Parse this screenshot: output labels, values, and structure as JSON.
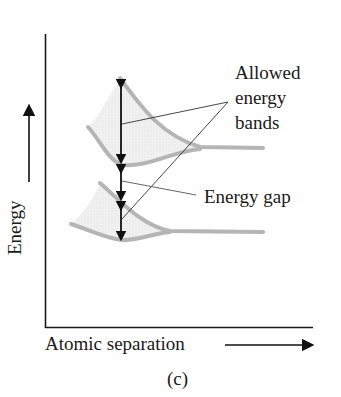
{
  "figure": {
    "panel_label": "(c)",
    "axes": {
      "x_label": "Atomic separation",
      "y_label": "Energy"
    },
    "annotations": {
      "allowed_line1": "Allowed",
      "allowed_line2": "energy",
      "allowed_line3": "bands",
      "gap": "Energy gap"
    },
    "colors": {
      "band_stroke": "#b5b5b5",
      "band_fill": "#ececec",
      "axis": "#1a1a1a",
      "arrow": "#111111"
    }
  }
}
